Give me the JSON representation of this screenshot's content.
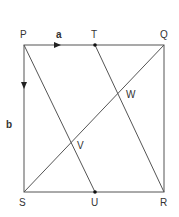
{
  "diagram": {
    "type": "geometry",
    "shape": "square PQRS",
    "points": {
      "P": {
        "label": "P",
        "x": 24,
        "y": 45
      },
      "Q": {
        "label": "Q",
        "x": 164,
        "y": 45
      },
      "R": {
        "label": "R",
        "x": 164,
        "y": 192
      },
      "S": {
        "label": "S",
        "x": 24,
        "y": 192
      },
      "T": {
        "label": "T",
        "x": 95,
        "y": 45
      },
      "U": {
        "label": "U",
        "x": 95,
        "y": 192
      },
      "W": {
        "label": "W"
      },
      "V": {
        "label": "V"
      }
    },
    "vectors": {
      "a": {
        "label": "a",
        "along": "PQ"
      },
      "b": {
        "label": "b",
        "along": "PS"
      }
    },
    "segments": [
      "PQ",
      "QR",
      "RS",
      "SP",
      "PU",
      "TR",
      "SQ"
    ],
    "intersections": {
      "V": "PU ∩ SQ",
      "W": "TR ∩ SQ"
    },
    "line_color": "#555555"
  }
}
